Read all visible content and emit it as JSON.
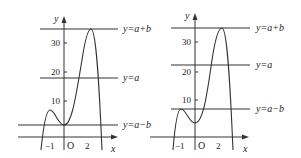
{
  "figures": [
    {
      "id": "left",
      "axis_labels": {
        "x": "x",
        "y": "y",
        "origin": "O"
      },
      "y_ticks": [
        "10",
        "20",
        "30"
      ],
      "x_ticks": [
        "−1",
        "2"
      ],
      "lines": [
        {
          "label": "y=a+b"
        },
        {
          "label": "y=a"
        },
        {
          "label": "y=a−b"
        }
      ]
    },
    {
      "id": "right",
      "axis_labels": {
        "x": "x",
        "y": "y",
        "origin": "O"
      },
      "y_ticks": [
        "10",
        "20",
        "30"
      ],
      "x_ticks": [
        "−1",
        "2"
      ],
      "lines": [
        {
          "label": "y=a+b"
        },
        {
          "label": "y=a"
        },
        {
          "label": "y=a−b"
        }
      ]
    }
  ],
  "colors": {
    "stroke": "#333333",
    "background": "#ffffff"
  }
}
